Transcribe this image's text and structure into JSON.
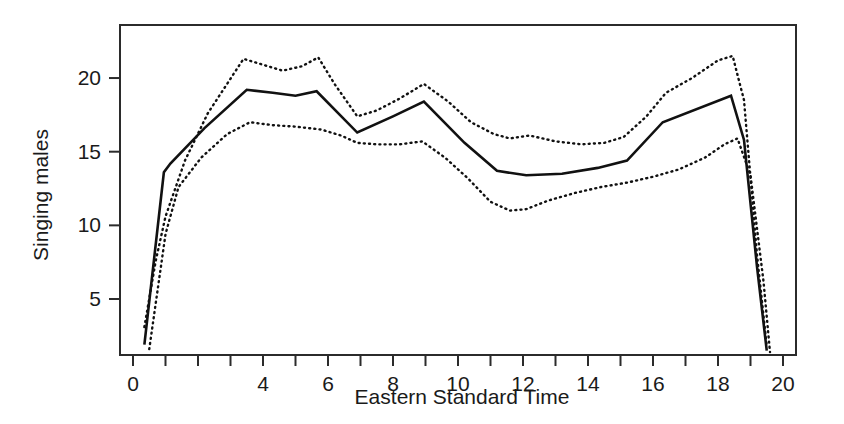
{
  "chart_data": {
    "type": "line",
    "title": "",
    "xlabel": "Eastern Standard Time",
    "ylabel": "Singing males",
    "xlim": [
      -0.4,
      20.4
    ],
    "ylim": [
      1.2,
      23.6
    ],
    "grid": false,
    "legend": "none",
    "x_ticks_major": [
      0,
      4,
      6,
      8,
      10,
      12,
      14,
      16,
      18,
      20
    ],
    "x_tick_labels": [
      "0",
      "4",
      "6",
      "8",
      "10",
      "12",
      "14",
      "16",
      "18",
      "20"
    ],
    "x_ticks_minor": [
      0,
      1,
      2,
      3,
      4,
      5,
      6,
      7,
      8,
      9,
      10,
      11,
      12,
      13,
      14,
      15,
      16,
      17,
      18,
      19,
      20
    ],
    "y_ticks": [
      5,
      10,
      15,
      20
    ],
    "y_tick_labels": [
      "5",
      "10",
      "15",
      "20"
    ],
    "series": [
      {
        "name": "upper confidence band",
        "style": "dotted",
        "x": [
          0.35,
          0.7,
          1.0,
          1.6,
          2.3,
          3.4,
          4.0,
          4.6,
          5.2,
          5.7,
          6.2,
          6.9,
          7.5,
          8.2,
          8.95,
          9.7,
          10.4,
          11.1,
          11.6,
          12.2,
          13.0,
          13.8,
          14.5,
          15.1,
          15.8,
          16.4,
          17.2,
          18.0,
          18.45,
          18.8,
          19.2,
          19.5
        ],
        "values": [
          3.1,
          7.6,
          10.6,
          14.4,
          17.6,
          21.3,
          20.9,
          20.5,
          20.8,
          21.4,
          19.6,
          17.4,
          17.8,
          18.6,
          19.6,
          18.4,
          17.0,
          16.2,
          15.9,
          16.1,
          15.7,
          15.5,
          15.6,
          16.0,
          17.4,
          19.0,
          20.0,
          21.2,
          21.5,
          18.5,
          8.0,
          1.8
        ]
      },
      {
        "name": "mean",
        "style": "solid",
        "x": [
          0.35,
          0.95,
          1.15,
          2.2,
          3.5,
          4.3,
          5.0,
          5.65,
          6.9,
          8.0,
          8.95,
          10.2,
          11.2,
          12.1,
          13.2,
          14.3,
          15.2,
          16.3,
          18.4,
          18.8,
          19.2,
          19.5
        ],
        "values": [
          1.9,
          13.6,
          14.2,
          16.6,
          19.2,
          19.0,
          18.8,
          19.1,
          16.3,
          17.4,
          18.4,
          15.6,
          13.7,
          13.4,
          13.5,
          13.9,
          14.4,
          17.0,
          18.8,
          15.8,
          7.2,
          1.5
        ]
      },
      {
        "name": "lower confidence band",
        "style": "dotted",
        "x": [
          0.5,
          1.0,
          1.4,
          2.1,
          2.9,
          3.6,
          4.3,
          5.0,
          5.8,
          6.4,
          6.9,
          7.5,
          8.2,
          8.9,
          9.6,
          10.3,
          11.0,
          11.6,
          12.1,
          12.8,
          13.6,
          14.4,
          15.2,
          16.0,
          16.8,
          17.6,
          18.2,
          18.6,
          19.0,
          19.4,
          19.6
        ],
        "values": [
          1.6,
          9.4,
          12.6,
          14.6,
          16.2,
          17.0,
          16.8,
          16.7,
          16.5,
          16.1,
          15.6,
          15.5,
          15.5,
          15.7,
          14.6,
          13.2,
          11.6,
          11.0,
          11.1,
          11.7,
          12.2,
          12.6,
          12.9,
          13.3,
          13.8,
          14.6,
          15.5,
          15.9,
          13.4,
          6.2,
          1.4
        ]
      }
    ]
  },
  "axes": {
    "y_axis_title": "Singing males",
    "x_axis_title": "Eastern Standard Time"
  }
}
